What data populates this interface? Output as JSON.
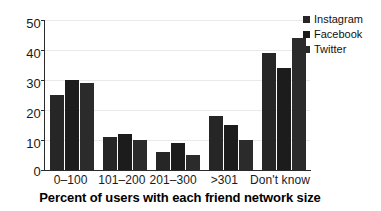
{
  "chart_data": {
    "type": "bar",
    "title": "",
    "xlabel": "Percent of users with each friend network size",
    "ylabel": "",
    "categories": [
      "0–100",
      "101–200",
      "201–300",
      ">301",
      "Don't know"
    ],
    "series": [
      {
        "name": "Instagram",
        "color": "#262626",
        "values": [
          25,
          11,
          6,
          18,
          39
        ]
      },
      {
        "name": "Facebook",
        "color": "#1c1c1c",
        "values": [
          30,
          12,
          9,
          15,
          34
        ]
      },
      {
        "name": "Twitter",
        "color": "#2b2b2b",
        "values": [
          29,
          10,
          5,
          10,
          44
        ]
      }
    ],
    "ylim": [
      0,
      50
    ],
    "yticks": [
      0,
      10,
      20,
      30,
      40,
      50
    ],
    "ytick_labels": [
      "0",
      "10",
      "20",
      "30",
      "40",
      "50"
    ],
    "grid": true,
    "legend_position": "top-right"
  },
  "legend": {
    "items": [
      {
        "label": "Instagram"
      },
      {
        "label": "Facebook"
      },
      {
        "label": "Twitter"
      }
    ]
  },
  "axis": {
    "x_title": "Percent of users with each friend network size"
  }
}
